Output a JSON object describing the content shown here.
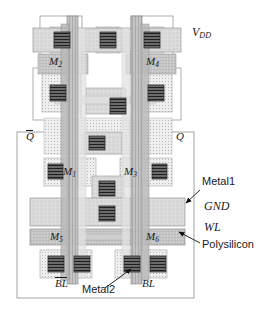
{
  "figure": {
    "kind": "ic-layout",
    "width": 268,
    "height": 320
  },
  "transistors": [
    {
      "id": "M1",
      "base": "M",
      "sub": "1",
      "x": 63,
      "y": 172
    },
    {
      "id": "M2",
      "base": "M",
      "sub": "2",
      "x": 50,
      "y": 62
    },
    {
      "id": "M3",
      "base": "M",
      "sub": "3",
      "x": 124,
      "y": 172
    },
    {
      "id": "M4",
      "base": "M",
      "sub": "4",
      "x": 146,
      "y": 62
    },
    {
      "id": "M5",
      "base": "M",
      "sub": "5",
      "x": 50,
      "y": 238
    },
    {
      "id": "M6",
      "base": "M",
      "sub": "6",
      "x": 146,
      "y": 238
    }
  ],
  "nets": {
    "vdd": {
      "base": "V",
      "sub": "DD",
      "x": 192,
      "y": 33
    },
    "gnd": {
      "text": "GND",
      "x": 205,
      "y": 206
    },
    "wl": {
      "text": "WL",
      "x": 205,
      "y": 227
    },
    "q_bar": {
      "text": "Q",
      "overline": true,
      "x": 26,
      "y": 138
    },
    "q": {
      "text": "Q",
      "overline": false,
      "x": 176,
      "y": 138
    },
    "bl_bar": {
      "text": "BL",
      "overline": true,
      "x": 55,
      "y": 284
    },
    "bl": {
      "text": "BL",
      "overline": false,
      "x": 140,
      "y": 284
    }
  },
  "callouts": [
    {
      "id": "metal1",
      "text": "Metal1",
      "x": 202,
      "y": 182,
      "arrow_from": [
        200,
        190
      ],
      "arrow_to": [
        186,
        203
      ]
    },
    {
      "id": "polysilicon",
      "text": "Polysilicon",
      "x": 202,
      "y": 245,
      "arrow_from": [
        200,
        243
      ],
      "arrow_to": [
        179,
        232
      ]
    },
    {
      "id": "metal2",
      "text": "Metal2",
      "x": 85,
      "y": 290,
      "arrow_from": [
        105,
        288
      ],
      "arrow_to": [
        130,
        269
      ]
    }
  ],
  "layers": {
    "metal1": {
      "fill": "#d9d9d9",
      "stroke": "#8c8c8c",
      "name": "Metal1"
    },
    "metal2": {
      "fill": "#9a9a9a",
      "stroke": "#6e6e6e",
      "name": "Metal2"
    },
    "polysilicon": {
      "fill": "#bdbdbd",
      "stroke": "#7a7a7a",
      "name": "Polysilicon"
    },
    "diffusion": {
      "fill": "#e6e6e6",
      "stroke": "#999999",
      "name": "Diffusion"
    },
    "nwell": {
      "fill": "#ffffff",
      "stroke": "#808080",
      "name": "N-well"
    },
    "contact": {
      "fill": "#4a4a4a",
      "stroke": "#222222",
      "name": "Contact"
    }
  }
}
